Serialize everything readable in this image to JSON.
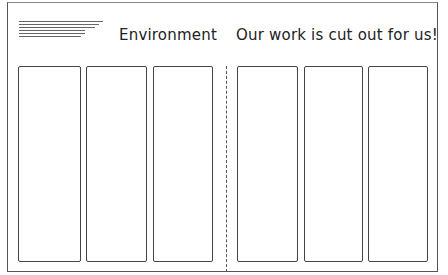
{
  "header": {
    "left_title": "Environment",
    "right_title": "Our work is cut out for us!"
  },
  "decoration": {
    "text_lines_icon": "text-lines-icon",
    "line_widths": [
      84,
      80,
      76,
      66,
      66,
      62
    ]
  },
  "left_group": {
    "panel_count": 3
  },
  "right_group": {
    "panel_count": 3
  }
}
